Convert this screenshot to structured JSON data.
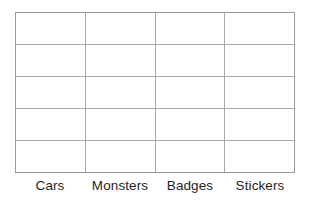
{
  "chart_data": {
    "type": "table",
    "title": "",
    "subtitle": "",
    "xlabel": "",
    "ylabel": "",
    "grid": true,
    "legend": null,
    "orientation": "vertical",
    "columns": 4,
    "rows": 5,
    "categories": [
      "Cars",
      "Monsters",
      "Badges",
      "Stickers"
    ],
    "values": [
      null,
      null,
      null,
      null
    ],
    "cells": [
      [
        "",
        "",
        "",
        ""
      ],
      [
        "",
        "",
        "",
        ""
      ],
      [
        "",
        "",
        "",
        ""
      ],
      [
        "",
        "",
        "",
        ""
      ],
      [
        "",
        "",
        "",
        ""
      ]
    ],
    "tick_labels": [
      "Cars",
      "Monsters",
      "Badges",
      "Stickers"
    ],
    "annotations": [],
    "colors": {
      "background": "#ffffff",
      "grid_line": "#a8a8a8",
      "border": "#9a9a9a",
      "label_text": "#1f1f1f"
    }
  },
  "axis": {
    "categories": [
      {
        "label": "Cars"
      },
      {
        "label": "Monsters"
      },
      {
        "label": "Badges"
      },
      {
        "label": "Stickers"
      }
    ]
  },
  "grid": {
    "rows": [
      {
        "cells": [
          "",
          "",
          "",
          ""
        ]
      },
      {
        "cells": [
          "",
          "",
          "",
          ""
        ]
      },
      {
        "cells": [
          "",
          "",
          "",
          ""
        ]
      },
      {
        "cells": [
          "",
          "",
          "",
          ""
        ]
      },
      {
        "cells": [
          "",
          "",
          "",
          ""
        ]
      }
    ]
  }
}
